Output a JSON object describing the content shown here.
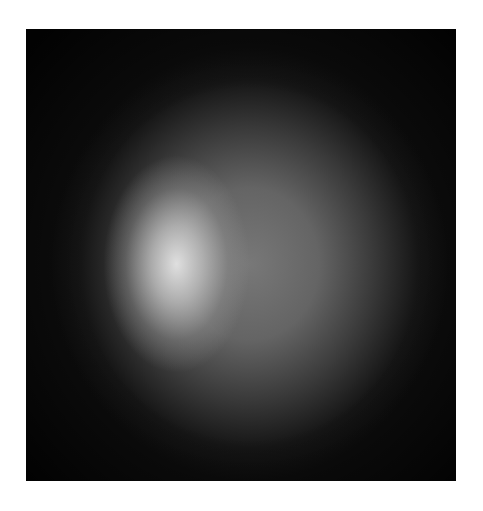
{
  "image": {
    "description": "Grayscale photograph of a diffuse glowing sphere on a dark background with a bright highlight left of center",
    "colors": {
      "background": "#ffffff",
      "photo_dark": "#0d0d0d",
      "sphere_mid": "#787878",
      "highlight": "#e6e6e6"
    }
  }
}
